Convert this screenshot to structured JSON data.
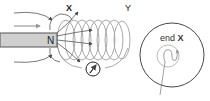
{
  "diagram": {
    "magnet": {
      "pole_label": "N",
      "fill": "#c8c8c8",
      "stroke": "#555555"
    },
    "coil": {
      "end_labels": {
        "left": "X",
        "right": "Y"
      },
      "stroke": "#9a9a9a"
    },
    "motion_arrow": {
      "color": "#888888"
    },
    "field_lines": {
      "color": "#444444"
    },
    "compass": {
      "stroke": "#222222"
    },
    "inset": {
      "title_prefix": "end",
      "title_end": "X",
      "stroke": "#333333",
      "inner_color": "#999999"
    }
  }
}
